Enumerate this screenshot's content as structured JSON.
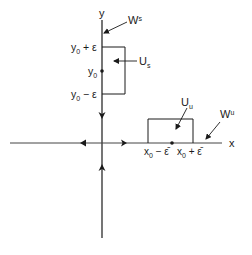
{
  "diagram": {
    "type": "phase-portrait-saddle",
    "axes": {
      "x_label": "x",
      "y_label": "y"
    },
    "stable_manifold": {
      "label": "W",
      "superscript": "s"
    },
    "unstable_manifold": {
      "label": "W",
      "superscript": "u"
    },
    "stable_neighborhood": {
      "label": "U",
      "subscript": "s",
      "top_label": "y",
      "top_sub": "0",
      "top_suffix": " + ε",
      "mid_label": "y",
      "mid_sub": "0",
      "bottom_label": "y",
      "bottom_sub": "0",
      "bottom_suffix": " − ε"
    },
    "unstable_neighborhood": {
      "label": "U",
      "subscript": "u",
      "left_label": "x",
      "left_sub": "0",
      "left_suffix": " − ε̄",
      "right_label": "x",
      "right_sub": "0",
      "right_suffix": " + ε̄"
    },
    "colors": {
      "ink": "#1a1a1a",
      "background": "#ffffff"
    }
  }
}
